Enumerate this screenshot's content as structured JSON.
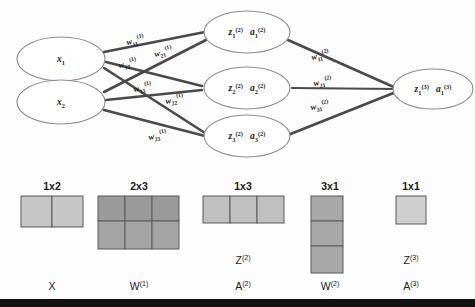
{
  "diagram": {
    "colors": {
      "edge": "#4a4a4a",
      "node_stroke": "#8d8d8d",
      "cell_light": "#c6c6c6",
      "cell_mid": "#b3b3b3",
      "cell_dark": "#9a9a9a",
      "cell_pale": "#cfcfcf",
      "bar": "#121212"
    },
    "input_nodes": [
      {
        "name": "x1",
        "base": "x",
        "sub": "1",
        "sup": ""
      },
      {
        "name": "x2",
        "base": "x",
        "sub": "2",
        "sup": ""
      }
    ],
    "hidden_nodes": [
      {
        "z_base": "z",
        "z_sub": "1",
        "z_sup": "(2)",
        "a_base": "a",
        "a_sub": "1",
        "a_sup": "(2)"
      },
      {
        "z_base": "z",
        "z_sub": "2",
        "z_sup": "(2)",
        "a_base": "a",
        "a_sub": "2",
        "a_sup": "(2)"
      },
      {
        "z_base": "z",
        "z_sub": "3",
        "z_sup": "(2)",
        "a_base": "a",
        "a_sub": "3",
        "a_sup": "(2)"
      }
    ],
    "output_nodes": [
      {
        "z_base": "z",
        "z_sub": "1",
        "z_sup": "(3)",
        "a_base": "a",
        "a_sub": "1",
        "a_sup": "(3)"
      }
    ],
    "layer1_weights": [
      {
        "base": "w",
        "sub": "11",
        "sup": "(1)"
      },
      {
        "base": "w",
        "sub": "21",
        "sup": "(1)"
      },
      {
        "base": "w",
        "sub": "12",
        "sup": "(1)"
      },
      {
        "base": "w",
        "sub": "13",
        "sup": "(1)"
      },
      {
        "base": "w",
        "sub": "22",
        "sup": "(1)"
      },
      {
        "base": "w",
        "sub": "23",
        "sup": "(1)"
      }
    ],
    "layer2_weights": [
      {
        "base": "w",
        "sub": "11",
        "sup": "(2)"
      },
      {
        "base": "w",
        "sub": "21",
        "sup": "(2)"
      },
      {
        "base": "w",
        "sub": "31",
        "sup": "(2)"
      }
    ],
    "matrices": [
      {
        "id": "X",
        "dim_label": "1x2",
        "rows": 1,
        "cols": 2,
        "name_base": "X",
        "name_sup": "",
        "alt_base": "",
        "alt_sup": "",
        "fill": "#c6c6c6"
      },
      {
        "id": "W1",
        "dim_label": "2x3",
        "rows": 2,
        "cols": 3,
        "name_base": "W",
        "name_sup": "(1)",
        "alt_base": "",
        "alt_sup": "",
        "fill": "#9a9a9a"
      },
      {
        "id": "A2",
        "dim_label": "1x3",
        "rows": 1,
        "cols": 3,
        "name_base": "A",
        "name_sup": "(2)",
        "alt_base": "Z",
        "alt_sup": "(2)",
        "fill": "#c0c0c0"
      },
      {
        "id": "W2",
        "dim_label": "3x1",
        "rows": 3,
        "cols": 1,
        "name_base": "W",
        "name_sup": "(2)",
        "alt_base": "",
        "alt_sup": "",
        "fill": "#a8a8a8"
      },
      {
        "id": "A3",
        "dim_label": "1x1",
        "rows": 1,
        "cols": 1,
        "name_base": "A",
        "name_sup": "(3)",
        "alt_base": "Z",
        "alt_sup": "(3)",
        "fill": "#cfcfcf"
      }
    ]
  }
}
